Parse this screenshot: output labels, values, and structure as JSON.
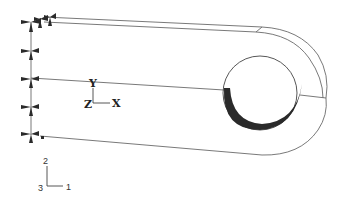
{
  "figure": {
    "type": "finite-element model wireframe",
    "model_axes": {
      "y_label": "Y",
      "z_label": "Z",
      "x_label": "X"
    },
    "global_triad": {
      "axis2": "2",
      "axis3": "3",
      "axis1": "1"
    },
    "boundary_condition_symbols": 7,
    "colors": {
      "lines": "#6a6a6a",
      "contact_region": "#1e1e1e",
      "background": "#ffffff"
    }
  }
}
